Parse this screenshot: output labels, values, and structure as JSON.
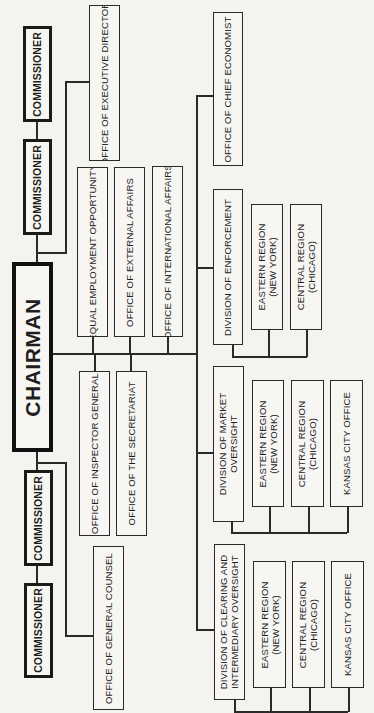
{
  "chart_title": "Organizational Chart",
  "orientation": "rotated 90 degrees counter-clockwise",
  "chairman": "CHAIRMAN",
  "commissioners": [
    "COMMISSIONER",
    "COMMISSIONER",
    "COMMISSIONER",
    "COMMISSIONER"
  ],
  "staff_offices": {
    "executive_director": "OFFICE OF EXECUTIVE DIRECTOR",
    "general_counsel": "OFFICE OF GENERAL COUNSEL",
    "equal_employment": "EQUAL EMPLOYMENT OPPORTUNITY",
    "external_affairs": "OFFICE OF EXTERNAL AFFAIRS",
    "international_affairs": "OFFICE OF INTERNATIONAL AFFAIRS",
    "inspector_general": "OFFICE OF INSPECTOR GENERAL",
    "secretariat": "OFFICE OF THE SECRETARIAT",
    "chief_economist": "OFFICE OF CHIEF ECONOMIST"
  },
  "divisions": {
    "enforcement": {
      "name": "DIVISION OF ENFORCEMENT",
      "units": [
        "EASTERN REGION\n(NEW YORK)",
        "CENTRAL REGION\n(CHICAGO)"
      ]
    },
    "market_oversight": {
      "name": "DIVISION OF MARKET\nOVERSIGHT",
      "units": [
        "EASTERN REGION\n(NEW YORK)",
        "CENTRAL REGION\n(CHICAGO)",
        "KANSAS CITY OFFICE"
      ]
    },
    "clearing": {
      "name": "DIVISION OF CLEARING AND\nINTERMEDIARY OVERSIGHT",
      "units": [
        "EASTERN REGION\n(NEW YORK)",
        "CENTRAL REGION\n(CHICAGO)",
        "KANSAS CITY OFFICE"
      ]
    }
  }
}
